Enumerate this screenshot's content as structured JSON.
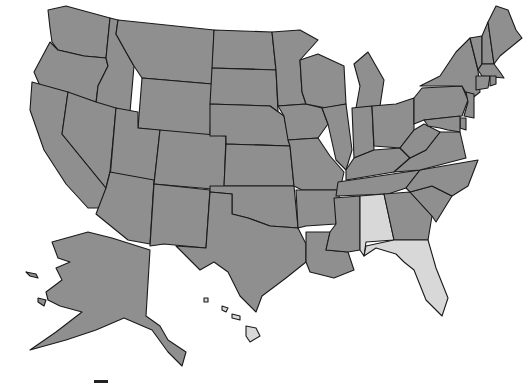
{
  "map": {
    "title": "United States map",
    "colors": {
      "default_fill": "#8f8f8f",
      "highlight_fill": "#d8d8d8",
      "border": "#1a1a1a",
      "background": "#ffffff"
    },
    "highlighted_states": [
      "Alabama",
      "Florida"
    ],
    "states": [
      {
        "name": "Washington",
        "fill": "#8f8f8f"
      },
      {
        "name": "Oregon",
        "fill": "#8f8f8f"
      },
      {
        "name": "California",
        "fill": "#8f8f8f"
      },
      {
        "name": "Idaho",
        "fill": "#8f8f8f"
      },
      {
        "name": "Nevada",
        "fill": "#8f8f8f"
      },
      {
        "name": "Montana",
        "fill": "#8f8f8f"
      },
      {
        "name": "Wyoming",
        "fill": "#8f8f8f"
      },
      {
        "name": "Utah",
        "fill": "#8f8f8f"
      },
      {
        "name": "Arizona",
        "fill": "#8f8f8f"
      },
      {
        "name": "Colorado",
        "fill": "#8f8f8f"
      },
      {
        "name": "New Mexico",
        "fill": "#8f8f8f"
      },
      {
        "name": "North Dakota",
        "fill": "#8f8f8f"
      },
      {
        "name": "South Dakota",
        "fill": "#8f8f8f"
      },
      {
        "name": "Nebraska",
        "fill": "#8f8f8f"
      },
      {
        "name": "Kansas",
        "fill": "#8f8f8f"
      },
      {
        "name": "Oklahoma",
        "fill": "#8f8f8f"
      },
      {
        "name": "Texas",
        "fill": "#8f8f8f"
      },
      {
        "name": "Minnesota",
        "fill": "#8f8f8f"
      },
      {
        "name": "Iowa",
        "fill": "#8f8f8f"
      },
      {
        "name": "Missouri",
        "fill": "#8f8f8f"
      },
      {
        "name": "Arkansas",
        "fill": "#8f8f8f"
      },
      {
        "name": "Louisiana",
        "fill": "#8f8f8f"
      },
      {
        "name": "Wisconsin",
        "fill": "#8f8f8f"
      },
      {
        "name": "Illinois",
        "fill": "#8f8f8f"
      },
      {
        "name": "Michigan",
        "fill": "#8f8f8f"
      },
      {
        "name": "Indiana",
        "fill": "#8f8f8f"
      },
      {
        "name": "Ohio",
        "fill": "#8f8f8f"
      },
      {
        "name": "Kentucky",
        "fill": "#8f8f8f"
      },
      {
        "name": "Tennessee",
        "fill": "#8f8f8f"
      },
      {
        "name": "Mississippi",
        "fill": "#8f8f8f"
      },
      {
        "name": "Alabama",
        "fill": "#d8d8d8"
      },
      {
        "name": "Georgia",
        "fill": "#8f8f8f"
      },
      {
        "name": "Florida",
        "fill": "#d8d8d8"
      },
      {
        "name": "South Carolina",
        "fill": "#8f8f8f"
      },
      {
        "name": "North Carolina",
        "fill": "#8f8f8f"
      },
      {
        "name": "Virginia",
        "fill": "#8f8f8f"
      },
      {
        "name": "West Virginia",
        "fill": "#8f8f8f"
      },
      {
        "name": "Pennsylvania",
        "fill": "#8f8f8f"
      },
      {
        "name": "New York",
        "fill": "#8f8f8f"
      },
      {
        "name": "Vermont",
        "fill": "#8f8f8f"
      },
      {
        "name": "New Hampshire",
        "fill": "#8f8f8f"
      },
      {
        "name": "Maine",
        "fill": "#8f8f8f"
      },
      {
        "name": "Massachusetts",
        "fill": "#8f8f8f"
      },
      {
        "name": "Connecticut",
        "fill": "#8f8f8f"
      },
      {
        "name": "Rhode Island",
        "fill": "#8f8f8f"
      },
      {
        "name": "New Jersey",
        "fill": "#8f8f8f"
      },
      {
        "name": "Delaware",
        "fill": "#8f8f8f"
      },
      {
        "name": "Maryland",
        "fill": "#8f8f8f"
      },
      {
        "name": "Alaska",
        "fill": "#8f8f8f"
      },
      {
        "name": "Hawaii",
        "fill": "#d8d8d8"
      }
    ]
  }
}
